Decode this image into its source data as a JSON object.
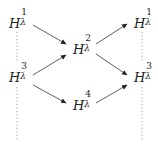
{
  "diagram": {
    "type": "commutative-diagram",
    "nodes": [
      {
        "id": "L1",
        "base": "H",
        "sub": "λ",
        "sup": "1",
        "x": 9,
        "y": 14,
        "column": "left",
        "row": "top"
      },
      {
        "id": "L3",
        "base": "H",
        "sub": "λ",
        "sup": "3",
        "x": 9,
        "y": 68,
        "column": "left",
        "row": "bottom"
      },
      {
        "id": "M2",
        "base": "H",
        "sub": "λ",
        "sup": "2",
        "x": 73,
        "y": 40,
        "column": "middle",
        "row": "top"
      },
      {
        "id": "M4",
        "base": "H",
        "sub": "λ",
        "sup": "4",
        "x": 73,
        "y": 96,
        "column": "middle",
        "row": "bottom"
      },
      {
        "id": "R1",
        "base": "H",
        "sub": "λ",
        "sup": "1",
        "x": 134,
        "y": 14,
        "column": "right",
        "row": "top"
      },
      {
        "id": "R3",
        "base": "H",
        "sub": "λ",
        "sup": "3",
        "x": 134,
        "y": 68,
        "column": "right",
        "row": "bottom"
      }
    ],
    "arrows": [
      {
        "from": "L1",
        "to": "M2",
        "style": "solid"
      },
      {
        "from": "L3",
        "to": "M2",
        "style": "solid"
      },
      {
        "from": "L3",
        "to": "M4",
        "style": "solid"
      },
      {
        "from": "M2",
        "to": "R1",
        "style": "solid"
      },
      {
        "from": "M2",
        "to": "R3",
        "style": "solid"
      },
      {
        "from": "M4",
        "to": "R3",
        "style": "solid"
      }
    ],
    "dotted_lines": [
      {
        "below": "L1",
        "x": 17,
        "y1": 32,
        "y2": 62
      },
      {
        "below": "L3",
        "x": 17,
        "y1": 87,
        "y2": 140
      },
      {
        "below": "R1",
        "x": 142,
        "y1": 32,
        "y2": 62
      },
      {
        "below": "R3",
        "x": 142,
        "y1": 87,
        "y2": 140
      }
    ],
    "colors": {
      "ink": "#222222",
      "dotted": "#888888",
      "background": "#ffffff"
    }
  }
}
